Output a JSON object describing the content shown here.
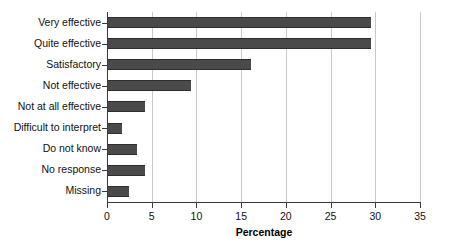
{
  "chart_data": {
    "type": "bar",
    "orientation": "horizontal",
    "title": "",
    "xlabel": "Percentage",
    "ylabel": "",
    "xlim": [
      0,
      35
    ],
    "xticks": [
      0,
      5,
      10,
      15,
      20,
      25,
      30,
      35
    ],
    "grid": true,
    "legend": false,
    "bar_color": "#4a4a4a",
    "gridline_color": "#c9c9c9",
    "axis_color": "#3a3a3a",
    "background_color": "#ffffff",
    "categories": [
      "Very effective",
      "Quite effective",
      "Satisfactory",
      "Not effective",
      "Not at all effective",
      "Difficult to interpret",
      "Do not know",
      "No response",
      "Missing"
    ],
    "values": [
      29.5,
      29.5,
      16.1,
      9.4,
      4.2,
      1.7,
      3.3,
      4.2,
      2.5
    ]
  }
}
